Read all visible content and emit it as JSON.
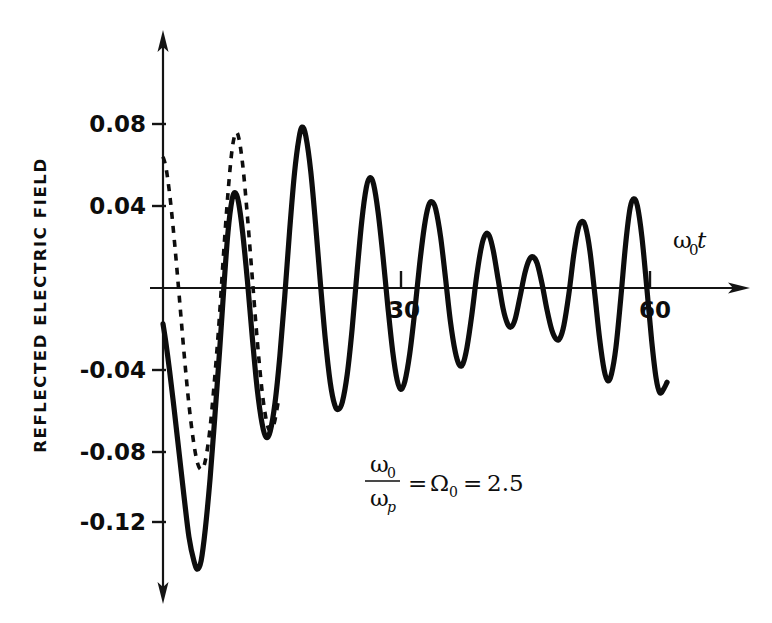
{
  "figure": {
    "background": "#ffffff",
    "ink_color": "#0d0d0d"
  },
  "chart_data": {
    "type": "line",
    "title": "",
    "xlabel": "ω₀t",
    "ylabel": "REFLECTED ELECTRIC FIELD",
    "xlim": [
      0,
      72
    ],
    "ylim": [
      -0.145,
      0.095
    ],
    "grid": false,
    "legend": "none",
    "x_ticks": [
      30,
      60
    ],
    "x_tick_labels": [
      "30",
      "60"
    ],
    "y_ticks": [
      0.08,
      0.04,
      -0.04,
      -0.08,
      -0.12
    ],
    "y_tick_labels": [
      "0.08",
      "0.04",
      "-0.04",
      "-0.08",
      "-0.12"
    ],
    "annotations": [
      {
        "name": "frequency-ratio-equation",
        "numerator": "ω",
        "numerator_sub": "0",
        "denominator": "ω",
        "denominator_sub": "p",
        "equals_1": "=",
        "symbol": "Ω",
        "symbol_sub": "0",
        "equals_2": "=",
        "value": "2.5",
        "text": "ω₀/ωₚ = Ω₀ = 2.5"
      }
    ],
    "series": [
      {
        "name": "solid-curve",
        "style": "solid",
        "points": [
          [
            0.0,
            -0.0175
          ],
          [
            0.35,
            -0.0265
          ],
          [
            0.8,
            -0.04
          ],
          [
            1.4,
            -0.06
          ],
          [
            2.0,
            -0.081
          ],
          [
            2.6,
            -0.102
          ],
          [
            3.2,
            -0.1215
          ],
          [
            3.8,
            -0.133
          ],
          [
            4.25,
            -0.1372
          ],
          [
            4.7,
            -0.133
          ],
          [
            5.2,
            -0.118
          ],
          [
            5.8,
            -0.093
          ],
          [
            6.4,
            -0.062
          ],
          [
            7.0,
            -0.029
          ],
          [
            7.5,
            0.0005
          ],
          [
            8.0,
            0.027
          ],
          [
            8.5,
            0.043
          ],
          [
            8.9,
            0.0465
          ],
          [
            9.3,
            0.042
          ],
          [
            9.8,
            0.0275
          ],
          [
            10.4,
            0.0035
          ],
          [
            11.0,
            -0.024
          ],
          [
            11.6,
            -0.049
          ],
          [
            12.2,
            -0.066
          ],
          [
            12.7,
            -0.0728
          ],
          [
            13.2,
            -0.07
          ],
          [
            13.8,
            -0.056
          ],
          [
            14.4,
            -0.033
          ],
          [
            15.0,
            -0.004
          ],
          [
            15.6,
            0.028
          ],
          [
            16.2,
            0.056
          ],
          [
            16.75,
            0.073
          ],
          [
            17.15,
            0.0785
          ],
          [
            17.6,
            0.074
          ],
          [
            18.2,
            0.057
          ],
          [
            18.8,
            0.031
          ],
          [
            19.4,
            0.002
          ],
          [
            20.0,
            -0.025
          ],
          [
            20.6,
            -0.046
          ],
          [
            21.15,
            -0.057
          ],
          [
            21.6,
            -0.0592
          ],
          [
            22.1,
            -0.0555
          ],
          [
            22.7,
            -0.042
          ],
          [
            23.3,
            -0.02
          ],
          [
            23.9,
            0.0075
          ],
          [
            24.5,
            0.033
          ],
          [
            25.05,
            0.049
          ],
          [
            25.5,
            0.0538
          ],
          [
            25.95,
            0.0505
          ],
          [
            26.5,
            0.037
          ],
          [
            27.1,
            0.0155
          ],
          [
            27.7,
            -0.009
          ],
          [
            28.3,
            -0.031
          ],
          [
            28.85,
            -0.045
          ],
          [
            29.3,
            -0.0495
          ],
          [
            29.8,
            -0.0455
          ],
          [
            30.4,
            -0.032
          ],
          [
            31.0,
            -0.012
          ],
          [
            31.6,
            0.011
          ],
          [
            32.2,
            0.03
          ],
          [
            32.7,
            0.04
          ],
          [
            33.15,
            0.042
          ],
          [
            33.6,
            0.0385
          ],
          [
            34.2,
            0.025
          ],
          [
            34.8,
            0.005
          ],
          [
            35.4,
            -0.016
          ],
          [
            36.0,
            -0.031
          ],
          [
            36.5,
            -0.0375
          ],
          [
            36.95,
            -0.037
          ],
          [
            37.45,
            -0.029
          ],
          [
            38.05,
            -0.013
          ],
          [
            38.65,
            0.006
          ],
          [
            39.25,
            0.0205
          ],
          [
            39.75,
            0.0262
          ],
          [
            40.2,
            0.0255
          ],
          [
            40.7,
            0.018
          ],
          [
            41.3,
            0.004
          ],
          [
            41.9,
            -0.01
          ],
          [
            42.45,
            -0.0175
          ],
          [
            42.9,
            -0.019
          ],
          [
            43.4,
            -0.015
          ],
          [
            44.0,
            -0.004
          ],
          [
            44.6,
            0.0075
          ],
          [
            45.15,
            0.014
          ],
          [
            45.6,
            0.0152
          ],
          [
            46.1,
            0.012
          ],
          [
            46.7,
            0.002
          ],
          [
            47.3,
            -0.0105
          ],
          [
            47.9,
            -0.0205
          ],
          [
            48.45,
            -0.025
          ],
          [
            48.9,
            -0.0245
          ],
          [
            49.4,
            -0.018
          ],
          [
            50.0,
            -0.003
          ],
          [
            50.6,
            0.016
          ],
          [
            51.15,
            0.029
          ],
          [
            51.6,
            0.0325
          ],
          [
            52.05,
            0.03
          ],
          [
            52.6,
            0.018
          ],
          [
            53.2,
            -0.003
          ],
          [
            53.8,
            -0.025
          ],
          [
            54.35,
            -0.04
          ],
          [
            54.8,
            -0.0452
          ],
          [
            55.25,
            -0.042
          ],
          [
            55.8,
            -0.029
          ],
          [
            56.4,
            -0.005
          ],
          [
            57.0,
            0.0215
          ],
          [
            57.55,
            0.039
          ],
          [
            58.0,
            0.0435
          ],
          [
            58.45,
            0.04
          ],
          [
            59.0,
            0.025
          ],
          [
            59.6,
            0.0005
          ],
          [
            60.2,
            -0.0255
          ],
          [
            60.75,
            -0.044
          ],
          [
            61.2,
            -0.051
          ],
          [
            61.65,
            -0.0495
          ],
          [
            62.1,
            -0.046
          ]
        ]
      },
      {
        "name": "dashed-curve",
        "style": "dashed",
        "points": [
          [
            0.0,
            0.064
          ],
          [
            0.4,
            0.058
          ],
          [
            0.9,
            0.043
          ],
          [
            1.45,
            0.021
          ],
          [
            2.0,
            -0.004
          ],
          [
            2.6,
            -0.032
          ],
          [
            3.2,
            -0.057
          ],
          [
            3.8,
            -0.076
          ],
          [
            4.3,
            -0.086
          ],
          [
            4.75,
            -0.0885
          ],
          [
            5.2,
            -0.0845
          ],
          [
            5.75,
            -0.07
          ],
          [
            6.3,
            -0.047
          ],
          [
            6.9,
            -0.017
          ],
          [
            7.45,
            0.016
          ],
          [
            8.0,
            0.046
          ],
          [
            8.5,
            0.0672
          ],
          [
            8.95,
            0.0755
          ],
          [
            9.35,
            0.073
          ],
          [
            9.85,
            0.059
          ],
          [
            10.4,
            0.035
          ],
          [
            11.0,
            0.005
          ],
          [
            11.6,
            -0.025
          ],
          [
            12.2,
            -0.05
          ],
          [
            12.75,
            -0.065
          ],
          [
            13.2,
            -0.0695
          ],
          [
            13.7,
            -0.066
          ],
          [
            14.3,
            -0.053
          ]
        ]
      }
    ]
  },
  "axes": {
    "y_axis_name": "vertical-axis",
    "x_axis_name": "horizontal-axis",
    "arrow_up": true,
    "arrow_down": true,
    "arrow_right": true
  }
}
